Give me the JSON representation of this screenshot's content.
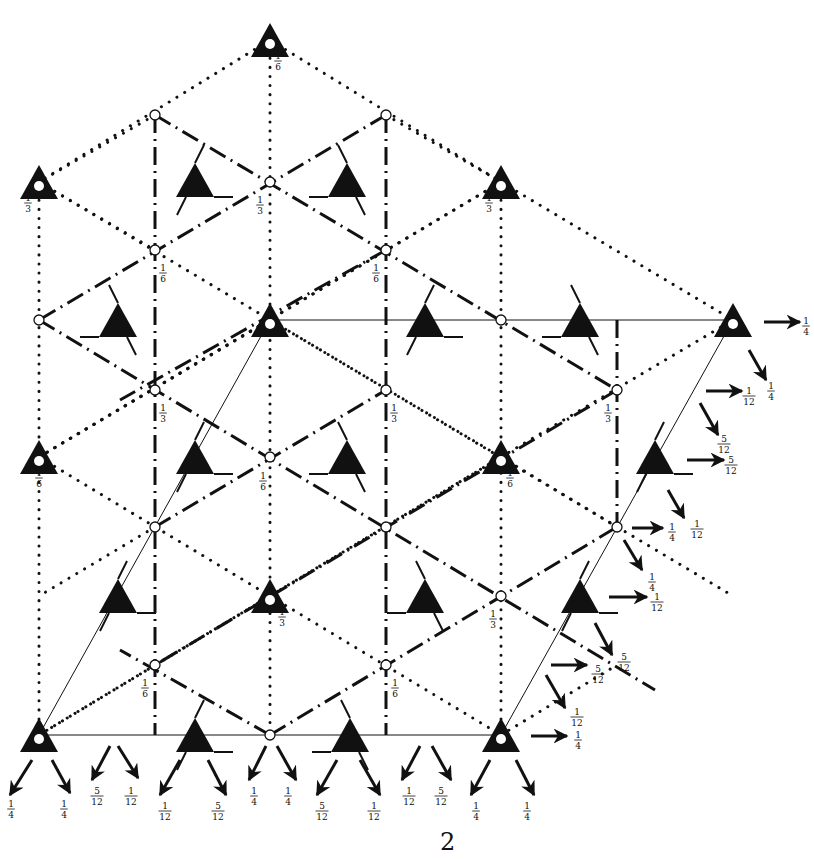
{
  "figure": {
    "page_number": "2",
    "colors": {
      "ink": "#111111",
      "background": "#ffffff"
    },
    "columns_x": [
      39,
      155,
      270,
      386,
      501,
      617,
      733
    ],
    "threefold_axes": [
      {
        "x": 270,
        "y": 40,
        "label": "1/6",
        "lx": 278,
        "ly": 60
      },
      {
        "x": 39,
        "y": 182,
        "label": "1/3",
        "lx": 28,
        "ly": 202
      },
      {
        "x": 501,
        "y": 182,
        "label": "1/3",
        "lx": 489,
        "ly": 202
      },
      {
        "x": 270,
        "y": 320,
        "label": "",
        "lx": 0,
        "ly": 0
      },
      {
        "x": 733,
        "y": 320,
        "label": "",
        "lx": 0,
        "ly": 0
      },
      {
        "x": 39,
        "y": 457,
        "label": "1/6",
        "lx": 39,
        "ly": 477
      },
      {
        "x": 501,
        "y": 457,
        "label": "1/6",
        "lx": 510,
        "ly": 477
      },
      {
        "x": 270,
        "y": 596,
        "label": "1/3",
        "lx": 282,
        "ly": 616
      },
      {
        "x": 39,
        "y": 735,
        "label": "",
        "lx": 0,
        "ly": 0
      },
      {
        "x": 501,
        "y": 735,
        "label": "",
        "lx": 0,
        "ly": 0
      }
    ],
    "inversion_centres": [
      {
        "x": 155,
        "y": 115,
        "label": ""
      },
      {
        "x": 386,
        "y": 115,
        "label": ""
      },
      {
        "x": 270,
        "y": 182,
        "label": "1/3",
        "lx": 260,
        "ly": 204
      },
      {
        "x": 155,
        "y": 250,
        "label": "1/6",
        "lx": 163,
        "ly": 272
      },
      {
        "x": 386,
        "y": 250,
        "label": "1/6",
        "lx": 376,
        "ly": 272
      },
      {
        "x": 39,
        "y": 320,
        "label": ""
      },
      {
        "x": 501,
        "y": 320,
        "label": ""
      },
      {
        "x": 155,
        "y": 390,
        "label": "1/3",
        "lx": 163,
        "ly": 412
      },
      {
        "x": 386,
        "y": 390,
        "label": "1/3",
        "lx": 394,
        "ly": 412
      },
      {
        "x": 617,
        "y": 390,
        "label": "1/3",
        "lx": 608,
        "ly": 412
      },
      {
        "x": 270,
        "y": 457,
        "label": "1/6",
        "lx": 263,
        "ly": 480
      },
      {
        "x": 155,
        "y": 527,
        "label": ""
      },
      {
        "x": 386,
        "y": 527,
        "label": ""
      },
      {
        "x": 617,
        "y": 527,
        "label": ""
      },
      {
        "x": 501,
        "y": 596,
        "label": "1/3",
        "lx": 493,
        "ly": 618
      },
      {
        "x": 155,
        "y": 665,
        "label": "1/6",
        "lx": 145,
        "ly": 687
      },
      {
        "x": 386,
        "y": 665,
        "label": "1/6",
        "lx": 395,
        "ly": 687
      },
      {
        "x": 270,
        "y": 735,
        "label": ""
      }
    ],
    "screw_axes": [
      {
        "x": 195,
        "y": 180,
        "hand": "left"
      },
      {
        "x": 347,
        "y": 180,
        "hand": "right"
      },
      {
        "x": 118,
        "y": 320,
        "hand": "right"
      },
      {
        "x": 425,
        "y": 320,
        "hand": "left"
      },
      {
        "x": 580,
        "y": 320,
        "hand": "right"
      },
      {
        "x": 195,
        "y": 457,
        "hand": "left"
      },
      {
        "x": 347,
        "y": 457,
        "hand": "right"
      },
      {
        "x": 655,
        "y": 457,
        "hand": "left"
      },
      {
        "x": 118,
        "y": 596,
        "hand": "left"
      },
      {
        "x": 425,
        "y": 596,
        "hand": "right"
      },
      {
        "x": 580,
        "y": 596,
        "hand": "left"
      },
      {
        "x": 195,
        "y": 735,
        "hand": "left"
      },
      {
        "x": 350,
        "y": 735,
        "hand": "right"
      }
    ],
    "cell_outline": [
      [
        270,
        320
      ],
      [
        733,
        320
      ],
      [
        501,
        735
      ],
      [
        39,
        735
      ]
    ],
    "bottom_arrows": [
      {
        "x1": 32,
        "y1": 760,
        "x2": 10,
        "y2": 795,
        "label": "1/4",
        "lx": 11,
        "ly": 808
      },
      {
        "x1": 52,
        "y1": 760,
        "x2": 70,
        "y2": 793,
        "label": "1/4",
        "lx": 64,
        "ly": 808
      },
      {
        "x1": 110,
        "y1": 746,
        "x2": 92,
        "y2": 780,
        "label": "5/12",
        "lx": 97,
        "ly": 795
      },
      {
        "x1": 118,
        "y1": 746,
        "x2": 138,
        "y2": 778,
        "label": "1/12",
        "lx": 131,
        "ly": 795
      },
      {
        "x1": 180,
        "y1": 760,
        "x2": 160,
        "y2": 795,
        "label": "1/12",
        "lx": 165,
        "ly": 810
      },
      {
        "x1": 208,
        "y1": 760,
        "x2": 226,
        "y2": 795,
        "label": "5/12",
        "lx": 218,
        "ly": 810
      },
      {
        "x1": 266,
        "y1": 746,
        "x2": 249,
        "y2": 780,
        "label": "1/4",
        "lx": 254,
        "ly": 795
      },
      {
        "x1": 277,
        "y1": 746,
        "x2": 296,
        "y2": 780,
        "label": "1/4",
        "lx": 288,
        "ly": 795
      },
      {
        "x1": 337,
        "y1": 760,
        "x2": 317,
        "y2": 795,
        "label": "5/12",
        "lx": 322,
        "ly": 810
      },
      {
        "x1": 360,
        "y1": 760,
        "x2": 380,
        "y2": 795,
        "label": "1/12",
        "lx": 374,
        "ly": 810
      },
      {
        "x1": 420,
        "y1": 746,
        "x2": 402,
        "y2": 780,
        "label": "1/12",
        "lx": 409,
        "ly": 795
      },
      {
        "x1": 432,
        "y1": 746,
        "x2": 451,
        "y2": 780,
        "label": "5/12",
        "lx": 441,
        "ly": 795
      },
      {
        "x1": 490,
        "y1": 760,
        "x2": 471,
        "y2": 795,
        "label": "1/4",
        "lx": 476,
        "ly": 810
      },
      {
        "x1": 516,
        "y1": 760,
        "x2": 534,
        "y2": 795,
        "label": "1/4",
        "lx": 527,
        "ly": 810
      }
    ],
    "right_arrows": [
      {
        "x1": 764,
        "y1": 322,
        "x2": 800,
        "y2": 322,
        "label": "1/4",
        "lx": 806,
        "ly": 325
      },
      {
        "x1": 749,
        "y1": 350,
        "x2": 766,
        "y2": 380,
        "label": "1/4",
        "lx": 771,
        "ly": 390
      },
      {
        "x1": 706,
        "y1": 391,
        "x2": 742,
        "y2": 391,
        "label": "1/12",
        "lx": 749,
        "ly": 395
      },
      {
        "x1": 700,
        "y1": 403,
        "x2": 718,
        "y2": 435,
        "label": "5/12",
        "lx": 724,
        "ly": 443
      },
      {
        "x1": 687,
        "y1": 460,
        "x2": 724,
        "y2": 460,
        "label": "5/12",
        "lx": 731,
        "ly": 464
      },
      {
        "x1": 668,
        "y1": 490,
        "x2": 684,
        "y2": 518,
        "label": "1/12",
        "lx": 697,
        "ly": 528
      },
      {
        "x1": 632,
        "y1": 528,
        "x2": 663,
        "y2": 528,
        "label": "1/4",
        "lx": 672,
        "ly": 531
      },
      {
        "x1": 624,
        "y1": 540,
        "x2": 642,
        "y2": 570,
        "label": "1/4",
        "lx": 652,
        "ly": 581
      },
      {
        "x1": 609,
        "y1": 597,
        "x2": 647,
        "y2": 597,
        "label": "1/12",
        "lx": 657,
        "ly": 601
      },
      {
        "x1": 595,
        "y1": 623,
        "x2": 612,
        "y2": 655,
        "label": "5/12",
        "lx": 624,
        "ly": 661
      },
      {
        "x1": 551,
        "y1": 665,
        "x2": 587,
        "y2": 665,
        "label": "5/12",
        "lx": 598,
        "ly": 673
      },
      {
        "x1": 546,
        "y1": 675,
        "x2": 565,
        "y2": 708,
        "label": "1/12",
        "lx": 577,
        "ly": 716
      },
      {
        "x1": 531,
        "y1": 736,
        "x2": 567,
        "y2": 736,
        "label": "1/4",
        "lx": 578,
        "ly": 739
      }
    ]
  }
}
